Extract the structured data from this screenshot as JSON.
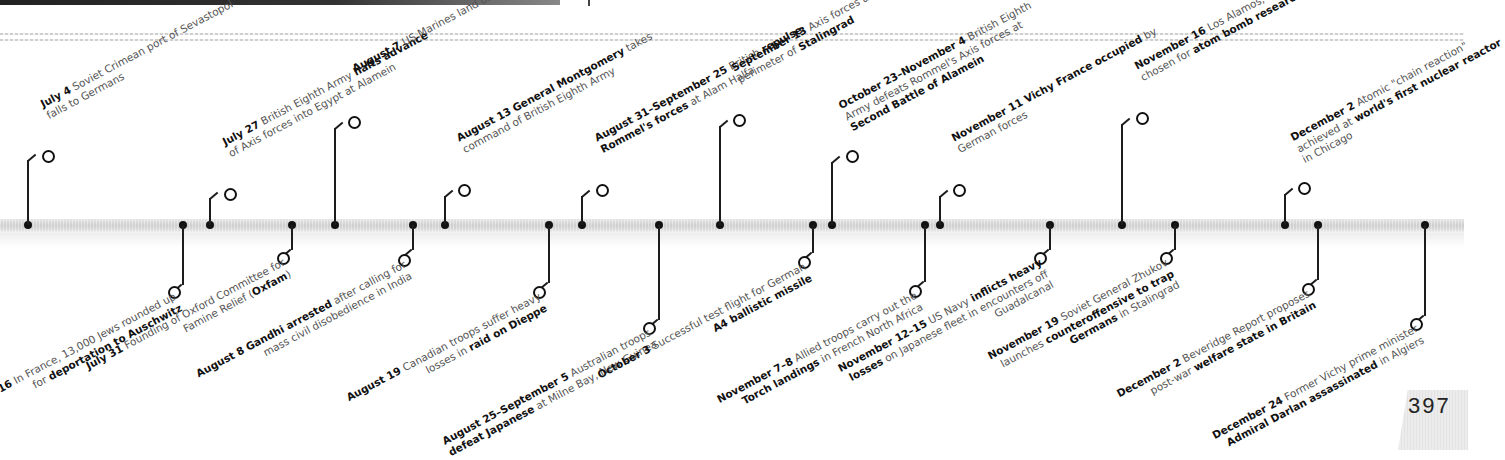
{
  "page": {
    "number": "397"
  },
  "timeline": {
    "top_events": [
      {
        "date": "July 4",
        "text": "Soviet Crimean port of Sevastopol falls to Germans",
        "bold": "after eight-month siege",
        "x": 28
      },
      {
        "date": "July 27",
        "text": "British Eighth Army halts advance of Axis forces into Egypt at Alamein",
        "bold": "halts advance",
        "x": 210
      },
      {
        "date": "August 7",
        "text": "US Marines land on Guadalcanal",
        "bold": "Guadalcanal",
        "x": 335
      },
      {
        "date": "August 13",
        "text": "General Montgomery takes command of British Eighth Army",
        "bold": "General Montgomery",
        "x": 445
      },
      {
        "date": "August 31–September 25",
        "text": "British repulse Rommel's forces at Alam Halfa",
        "bold": "repulse Rommel's forces",
        "x": 582
      },
      {
        "date": "September 13",
        "text": "Axis forces attack defensive perimeter of Stalingrad",
        "bold": "Stalingrad",
        "x": 720
      },
      {
        "date": "October 23–November 4",
        "text": "British Eighth Army defeats Rommel's Axis forces at Second Battle of Alamein",
        "bold": "Second Battle of Alamein",
        "x": 832
      },
      {
        "date": "November 11",
        "text": "Vichy France occupied by German forces",
        "bold": "Vichy France occupied",
        "x": 940
      },
      {
        "date": "November 16",
        "text": "Los Alamos, New Mexico, chosen for atom bomb research",
        "bold": "atom bomb research",
        "x": 1122
      },
      {
        "date": "December 2",
        "text": "Atomic \"chain reaction\" achieved at world's first nuclear reactor in Chicago",
        "bold": "world's first nuclear reactor",
        "x": 1285
      }
    ],
    "bottom_events": [
      {
        "date": "July 16",
        "text": "In France, 13,000 Jews rounded up for deportation to Auschwitz",
        "bold": "deportation to Auschwitz",
        "x": 183
      },
      {
        "date": "July 31",
        "text": "Founding of Oxford Committee for Famine Relief (Oxfam)",
        "bold": "Oxfam",
        "x": 292
      },
      {
        "date": "August 8",
        "text": "Gandhi arrested after calling for mass civil disobedience in India",
        "bold": "Gandhi arrested",
        "x": 413
      },
      {
        "date": "August 19",
        "text": "Canadian troops suffer heavy losses in raid on Dieppe",
        "bold": "raid on Dieppe",
        "x": 549
      },
      {
        "date": "August 25–September 5",
        "text": "Australian troops defeat Japanese at Milne Bay, New Guinea",
        "bold": "defeat Japanese",
        "x": 659
      },
      {
        "date": "October 3",
        "text": "Successful test flight for German A4 ballistic missile",
        "bold": "A4 ballistic missile",
        "x": 813
      },
      {
        "date": "November 7–8",
        "text": "Allied troops carry out the Torch landings in French North Africa",
        "bold": "Torch landings",
        "x": 925
      },
      {
        "date": "November 12–15",
        "text": "US Navy inflicts heavy losses on Japanese fleet in encounters off Guadalcanal",
        "bold": "inflicts heavy losses",
        "x": 1050
      },
      {
        "date": "November 19",
        "text": "Soviet General Zhukov launches counteroffensive to trap Germans in Stalingrad",
        "bold": "counteroffensive to trap Germans",
        "x": 1175
      },
      {
        "date": "December 2",
        "text": "Beveridge Report proposes post-war welfare state in Britain",
        "bold": "welfare state in Britain",
        "x": 1318
      },
      {
        "date": "December 24",
        "text": "Former Vichy prime minister Admiral Darlan assassinated in Algiers",
        "bold": "Admiral Darlan assassinated",
        "x": 1425
      }
    ]
  },
  "top_layout": [
    {
      "stem_top": 160,
      "ring_x": 42,
      "ring_y": 150,
      "label_x": 50,
      "label_y": 148
    },
    {
      "stem_top": 198,
      "ring_x": 224,
      "ring_y": 188,
      "label_x": 232,
      "label_y": 186
    },
    {
      "stem_top": 128,
      "ring_x": 348,
      "ring_y": 116,
      "label_x": 356,
      "label_y": 114
    },
    {
      "stem_top": 196,
      "ring_x": 458,
      "ring_y": 184,
      "label_x": 466,
      "label_y": 182
    },
    {
      "stem_top": 196,
      "ring_x": 596,
      "ring_y": 184,
      "label_x": 604,
      "label_y": 182
    },
    {
      "stem_top": 126,
      "ring_x": 733,
      "ring_y": 114,
      "label_x": 741,
      "label_y": 112
    },
    {
      "stem_top": 162,
      "ring_x": 846,
      "ring_y": 150,
      "label_x": 854,
      "label_y": 148
    },
    {
      "stem_top": 196,
      "ring_x": 953,
      "ring_y": 184,
      "label_x": 961,
      "label_y": 182
    },
    {
      "stem_top": 124,
      "ring_x": 1136,
      "ring_y": 112,
      "label_x": 1144,
      "label_y": 110
    },
    {
      "stem_top": 194,
      "ring_x": 1298,
      "ring_y": 182,
      "label_x": 1306,
      "label_y": 180
    }
  ],
  "bottom_layout": [
    {
      "stem_bottom": 285,
      "ring_x": 168,
      "ring_y": 286,
      "label_x": -68,
      "label_y": 290
    },
    {
      "stem_bottom": 250,
      "ring_x": 277,
      "ring_y": 252,
      "label_x": 41,
      "label_y": 256
    },
    {
      "stem_bottom": 250,
      "ring_x": 398,
      "ring_y": 254,
      "label_x": 162,
      "label_y": 258
    },
    {
      "stem_bottom": 283,
      "ring_x": 533,
      "ring_y": 286,
      "label_x": 297,
      "label_y": 290
    },
    {
      "stem_bottom": 320,
      "ring_x": 643,
      "ring_y": 322,
      "label_x": 407,
      "label_y": 326
    },
    {
      "stem_bottom": 253,
      "ring_x": 798,
      "ring_y": 256,
      "label_x": 562,
      "label_y": 260
    },
    {
      "stem_bottom": 282,
      "ring_x": 909,
      "ring_y": 285,
      "label_x": 673,
      "label_y": 289
    },
    {
      "stem_bottom": 250,
      "ring_x": 1034,
      "ring_y": 252,
      "label_x": 798,
      "label_y": 256
    },
    {
      "stem_bottom": 250,
      "ring_x": 1160,
      "ring_y": 252,
      "label_x": 924,
      "label_y": 256
    },
    {
      "stem_bottom": 280,
      "ring_x": 1302,
      "ring_y": 283,
      "label_x": 1066,
      "label_y": 287
    },
    {
      "stem_bottom": 316,
      "ring_x": 1410,
      "ring_y": 318,
      "label_x": 1174,
      "label_y": 322
    }
  ]
}
